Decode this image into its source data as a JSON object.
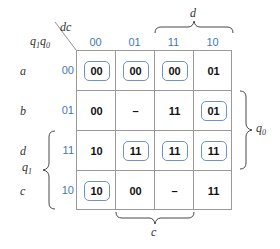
{
  "kmap": {
    "column_variable_label": "dc",
    "row_variable_label": "q1q0",
    "row_variable_parts": [
      "q",
      "1",
      "q",
      "0"
    ],
    "column_codes": [
      "00",
      "01",
      "11",
      "10"
    ],
    "rows": [
      {
        "name": "a",
        "code": "00",
        "cells": [
          {
            "value": "00",
            "boxed": true
          },
          {
            "value": "00",
            "boxed": true
          },
          {
            "value": "00",
            "boxed": true
          },
          {
            "value": "01",
            "boxed": false
          }
        ]
      },
      {
        "name": "b",
        "code": "01",
        "cells": [
          {
            "value": "00",
            "boxed": false
          },
          {
            "value": "–",
            "boxed": false
          },
          {
            "value": "11",
            "boxed": false
          },
          {
            "value": "01",
            "boxed": true
          }
        ]
      },
      {
        "name": "d",
        "code": "11",
        "cells": [
          {
            "value": "10",
            "boxed": false
          },
          {
            "value": "11",
            "boxed": true
          },
          {
            "value": "11",
            "boxed": true
          },
          {
            "value": "11",
            "boxed": true
          }
        ]
      },
      {
        "name": "c",
        "code": "10",
        "cells": [
          {
            "value": "10",
            "boxed": true
          },
          {
            "value": "00",
            "boxed": false
          },
          {
            "value": "–",
            "boxed": false
          },
          {
            "value": "11",
            "boxed": false
          }
        ]
      }
    ],
    "brackets": {
      "top": {
        "label": "d",
        "span_columns": [
          "11",
          "10"
        ]
      },
      "bottom": {
        "label": "c",
        "span_columns": [
          "01",
          "11"
        ]
      },
      "right": {
        "label": "q",
        "sub": "0",
        "span_rows": [
          "01",
          "11"
        ]
      },
      "left": {
        "label": "q",
        "sub": "1",
        "span_rows": [
          "11",
          "10"
        ]
      }
    },
    "colors": {
      "code_blue": "#3f78c0",
      "box_border": "#6f94c4",
      "grid": "#9a9a9a"
    }
  }
}
